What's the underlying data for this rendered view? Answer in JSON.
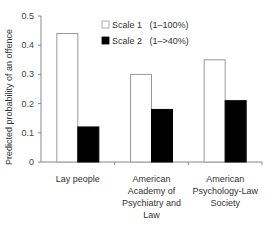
{
  "chart_data": {
    "type": "bar",
    "title": "",
    "xlabel": "",
    "ylabel": "Predicted probability of an offence",
    "ylim": [
      0,
      0.5
    ],
    "yticks": [
      "0",
      "0.1",
      "0.2",
      "0.3",
      "0.4",
      "0.5"
    ],
    "grid": false,
    "legend_position": "top-right",
    "categories": [
      [
        "Lay people"
      ],
      [
        "American",
        "Academy of",
        "Psychiatry and",
        "Law"
      ],
      [
        "American",
        "Psychology-Law",
        "Society"
      ]
    ],
    "series": [
      {
        "name": "Scale 1   (1–100%)",
        "color": "#ffffff",
        "values": [
          0.44,
          0.3,
          0.35
        ]
      },
      {
        "name": "Scale 2   (1–>40%)",
        "color": "#000000",
        "values": [
          0.12,
          0.18,
          0.21
        ]
      }
    ]
  }
}
